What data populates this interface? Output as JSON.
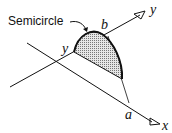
{
  "diagram": {
    "labels": {
      "semicircle": "Semicircle",
      "b": "b",
      "y_axis": "y",
      "y_point": "y",
      "a": "a",
      "x_axis": "x"
    },
    "colors": {
      "line": "#111111",
      "fill": "#c8c8c8",
      "background": "#ffffff"
    },
    "shape": "shaded semicircle on a skewed plane between x and y axes"
  }
}
